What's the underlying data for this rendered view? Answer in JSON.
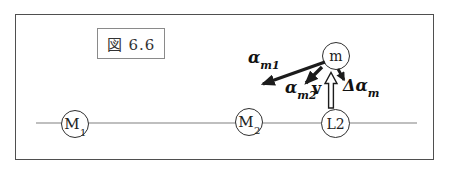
{
  "figure": {
    "caption": "図 6.6",
    "nodes": {
      "m1": {
        "base": "M",
        "sub": "1"
      },
      "m2": {
        "base": "M",
        "sub": "2"
      },
      "l2": {
        "base": "L2",
        "sub": ""
      },
      "m": {
        "base": "m",
        "sub": ""
      }
    },
    "vectors": {
      "alpha_m1": {
        "base": "α",
        "sub": "m1"
      },
      "alpha_m2": {
        "base": "α",
        "sub": "m2"
      },
      "velocity": {
        "base": "v",
        "sub": ""
      },
      "delta_alpha_m": {
        "base": "Δα",
        "sub": "m"
      }
    },
    "colors": {
      "frame": "#4f4f4f",
      "line": "#808080",
      "node_stroke": "#2f2f2f",
      "arrow": "#1c1c1c",
      "background": "#ffffff"
    }
  }
}
